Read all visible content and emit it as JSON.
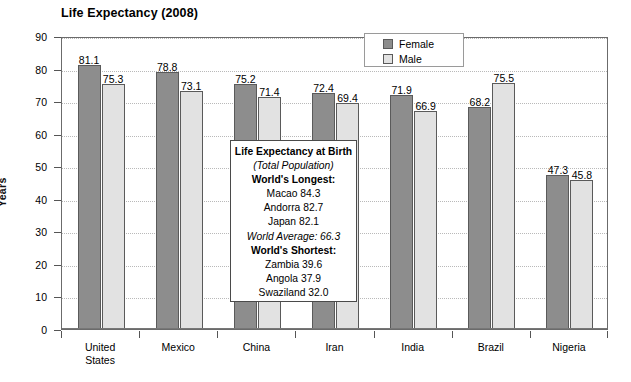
{
  "chart_data": {
    "type": "bar",
    "title": "Life Expectancy (2008)",
    "xlabel": "",
    "ylabel": "Years",
    "ylim": [
      0,
      90
    ],
    "ytick_step": 10,
    "yticks": [
      0,
      10,
      20,
      30,
      40,
      50,
      60,
      70,
      80,
      90
    ],
    "grid": true,
    "legend_position": "top-right",
    "categories": [
      "United States",
      "Mexico",
      "China",
      "Iran",
      "India",
      "Brazil",
      "Nigeria"
    ],
    "category_lines": [
      [
        "United",
        "States"
      ],
      [
        "Mexico"
      ],
      [
        "China"
      ],
      [
        "Iran"
      ],
      [
        "India"
      ],
      [
        "Brazil"
      ],
      [
        "Nigeria"
      ]
    ],
    "series": [
      {
        "name": "Female",
        "color": "#8d8d8d",
        "values": [
          81.1,
          78.8,
          75.2,
          72.4,
          71.9,
          68.2,
          47.3
        ]
      },
      {
        "name": "Male",
        "color": "#e2e2e2",
        "values": [
          75.3,
          73.1,
          71.4,
          69.4,
          66.9,
          75.5,
          45.8
        ]
      }
    ]
  },
  "legend": {
    "items": [
      {
        "label": "Female",
        "swatch": "female"
      },
      {
        "label": "Male",
        "swatch": "male"
      }
    ]
  },
  "callout": {
    "lines": [
      {
        "text": "Life Expectancy at Birth",
        "style": "bold"
      },
      {
        "text": "(Total Population)",
        "style": "italic"
      },
      {
        "text": "World's Longest:",
        "style": "bold"
      },
      {
        "text": "Macao 84.3",
        "style": "normal"
      },
      {
        "text": "Andorra 82.7",
        "style": "normal"
      },
      {
        "text": "Japan 82.1",
        "style": "normal"
      },
      {
        "text": "World Average: 66.3",
        "style": "italic"
      },
      {
        "text": "World's Shortest:",
        "style": "bold"
      },
      {
        "text": "Zambia 39.6",
        "style": "normal"
      },
      {
        "text": "Angola 37.9",
        "style": "normal"
      },
      {
        "text": "Swaziland 32.0",
        "style": "normal"
      }
    ]
  },
  "colors": {
    "female_bar": "#8d8d8d",
    "male_bar": "#e2e2e2",
    "bar_border": "#5a5a5a",
    "gridline": "#b9b9b9",
    "frame": "#6b6b6b",
    "text": "#000000",
    "background": "#ffffff"
  }
}
